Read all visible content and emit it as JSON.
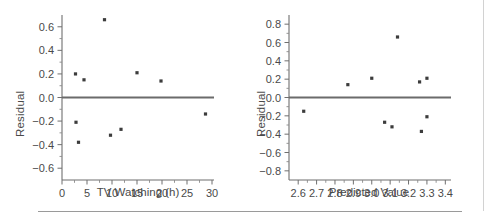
{
  "figure": {
    "background": "#ffffff",
    "axis_color": "#6f6f6f",
    "point_color": "#3c3c3c",
    "zero_line_color": "#6b6b6b",
    "divider_color": "#9a9a9a"
  },
  "chart_data": [
    {
      "type": "scatter",
      "title": "",
      "xlabel": "TV Watching (h)",
      "ylabel": "Residual",
      "xlim": [
        0,
        30
      ],
      "ylim": [
        -0.7,
        0.7
      ],
      "xticks": [
        0,
        5,
        10,
        15,
        20,
        25,
        30
      ],
      "xticklabels": [
        "0",
        "5",
        "10",
        "15",
        "20",
        "25",
        "30"
      ],
      "yticks": [
        -0.6,
        -0.4,
        -0.2,
        0.0,
        0.2,
        0.4,
        0.6
      ],
      "yticklabels": [
        "−0.6",
        "−0.4",
        "−0.2",
        "0.0",
        "0.2",
        "0.4",
        "0.6"
      ],
      "minor_x_interval": 2.5,
      "grid": false,
      "legend": "none",
      "annotations": [
        "horizontal reference line at Residual = 0"
      ],
      "x": [
        2.7,
        2.8,
        3.3,
        4.4,
        8.5,
        9.7,
        11.8,
        15.0,
        19.8,
        28.7
      ],
      "y": [
        0.2,
        -0.21,
        -0.38,
        0.15,
        0.66,
        -0.32,
        -0.27,
        0.21,
        0.14,
        -0.14
      ]
    },
    {
      "type": "scatter",
      "title": "",
      "xlabel": "Predicted Value",
      "ylabel": "Residual",
      "xlim": [
        2.55,
        3.42
      ],
      "ylim": [
        -0.9,
        0.9
      ],
      "xticks": [
        2.6,
        2.7,
        2.8,
        2.9,
        3.0,
        3.1,
        3.2,
        3.3,
        3.4
      ],
      "xticklabels": [
        "2.6",
        "2.7",
        "2.8",
        "2.9",
        "3.0",
        "3.1",
        "3.2",
        "3.3",
        "3.4"
      ],
      "yticks": [
        -0.8,
        -0.6,
        -0.4,
        -0.2,
        0.0,
        0.2,
        0.4,
        0.6,
        0.8
      ],
      "yticklabels": [
        "−0.8",
        "−0.6",
        "−0.4",
        "−0.2",
        "0.0",
        "0.2",
        "0.4",
        "0.6",
        "0.8"
      ],
      "minor_x_interval": 0.05,
      "grid": false,
      "legend": "none",
      "annotations": [
        "horizontal reference line at Residual = 0"
      ],
      "x": [
        2.63,
        2.87,
        3.0,
        3.07,
        3.11,
        3.14,
        3.26,
        3.27,
        3.3,
        3.3
      ],
      "y": [
        -0.15,
        0.14,
        0.21,
        -0.27,
        -0.32,
        0.66,
        0.17,
        -0.37,
        0.21,
        -0.21
      ]
    }
  ]
}
